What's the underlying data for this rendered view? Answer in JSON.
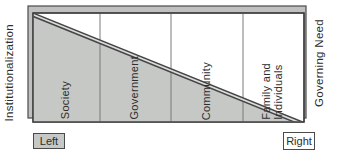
{
  "diagram": {
    "left_axis_label": "Institutionalization",
    "right_axis_label": "Governing Need",
    "zones": [
      "Society",
      "Government",
      "Community",
      "Family and\nIndividuals"
    ],
    "left_tag": "Left",
    "right_tag": "Right"
  },
  "colors": {
    "shaded_region": "#c6c8c5",
    "shadow_rect": "#bfc1be",
    "frame_border": "#3f3f3f",
    "column_divider": "#7a7a7a",
    "diagonal_band_edge": "#454545",
    "diagonal_band_core": "#dcdcdc",
    "text": "#2d2d2d"
  }
}
